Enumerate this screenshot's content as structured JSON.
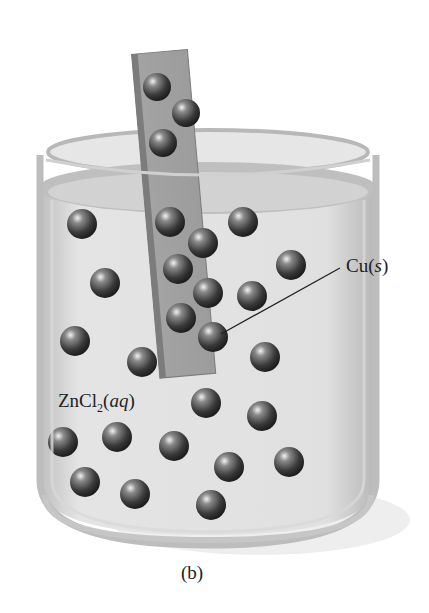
{
  "figure": {
    "panel_label": "(b)",
    "labels": {
      "electrode": {
        "symbol": "Cu",
        "state": "s"
      },
      "solution": {
        "prefix": "ZnCl",
        "subscript": "2",
        "state": "aq"
      }
    },
    "colors": {
      "background": "#ffffff",
      "beaker_glass": "#c9c9c9",
      "solution": "#dcdcdc",
      "strip": "#9a9a9a",
      "sphere": "#4a4a4a"
    },
    "strip_spheres_above_solution": 3,
    "strip_spheres_in_solution": 7,
    "solution_spheres": 17
  }
}
